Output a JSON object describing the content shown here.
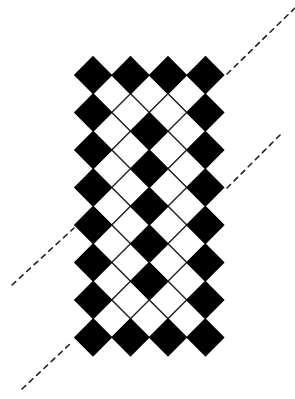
{
  "diagram": {
    "title": "",
    "background": "#ffffff",
    "pattern": {
      "type": "diamond-checker-lattice",
      "origin": {
        "x": 93,
        "y": 75
      },
      "half_diagonal": 18.75,
      "columns": 7,
      "rows": 15,
      "fill_color": "#000000",
      "outline_color": "#222222",
      "black_cells": [
        [
          0,
          0
        ],
        [
          2,
          0
        ],
        [
          4,
          0
        ],
        [
          6,
          0
        ],
        [
          0,
          2
        ],
        [
          6,
          2
        ],
        [
          0,
          4
        ],
        [
          6,
          4
        ],
        [
          0,
          6
        ],
        [
          6,
          6
        ],
        [
          0,
          8
        ],
        [
          6,
          8
        ],
        [
          0,
          10
        ],
        [
          6,
          10
        ],
        [
          0,
          12
        ],
        [
          6,
          12
        ],
        [
          0,
          14
        ],
        [
          2,
          14
        ],
        [
          4,
          14
        ],
        [
          6,
          14
        ],
        [
          3,
          3
        ],
        [
          3,
          5
        ],
        [
          3,
          7
        ],
        [
          3,
          9
        ],
        [
          3,
          11
        ]
      ]
    },
    "dashed_lines": [
      {
        "name": "dashed-line-top-right",
        "x1": 227,
        "y1": 74,
        "x2": 295,
        "y2": 8
      },
      {
        "name": "dashed-line-mid-right",
        "x1": 227,
        "y1": 188,
        "x2": 283,
        "y2": 132
      },
      {
        "name": "dashed-line-mid-left",
        "x1": 12,
        "y1": 285,
        "x2": 74,
        "y2": 228
      },
      {
        "name": "dashed-line-bottom-left",
        "x1": 22,
        "y1": 389,
        "x2": 71,
        "y2": 343
      }
    ],
    "dash_color": "#222222"
  }
}
